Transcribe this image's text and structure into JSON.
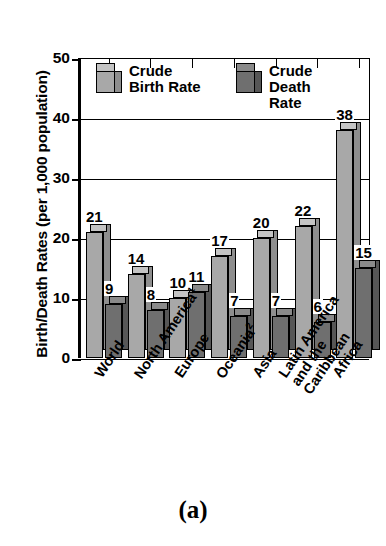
{
  "figure": {
    "caption": "(a)"
  },
  "chart_data": {
    "type": "bar",
    "title": "",
    "xlabel": "",
    "ylabel": "Birth/Death Rates (per 1,000 population)",
    "ylim": [
      0,
      50
    ],
    "yticks": [
      0,
      10,
      20,
      30,
      40,
      50
    ],
    "ytick_labels": [
      "0",
      "10",
      "20",
      "30",
      "40",
      "50"
    ],
    "grid": true,
    "legend_position": "inside-top",
    "categories": [
      "World",
      "North America¹",
      "Europe",
      "Oceania²",
      "Asia",
      "Latin America and the Caribbean",
      "Africa"
    ],
    "category_lines": [
      [
        "World"
      ],
      [
        "North America¹"
      ],
      [
        "Europe"
      ],
      [
        "Oceania²"
      ],
      [
        "Asia"
      ],
      [
        "Latin America",
        "and the",
        "Caribbean"
      ],
      [
        "Africa"
      ]
    ],
    "series": [
      {
        "name": "Crude Birth Rate",
        "legend_lines": [
          "Crude",
          "Birth Rate"
        ],
        "color": "#a8a8a8",
        "values": [
          21,
          14,
          10,
          17,
          20,
          22,
          38
        ]
      },
      {
        "name": "Crude Death Rate",
        "legend_lines": [
          "Crude",
          "Death Rate"
        ],
        "color": "#6f6f6f",
        "values": [
          9,
          8,
          11,
          7,
          7,
          6,
          15
        ]
      }
    ],
    "value_labels": [
      "21",
      "9",
      "14",
      "8",
      "10",
      "11",
      "17",
      "7",
      "20",
      "7",
      "22",
      "6",
      "38",
      "15"
    ]
  },
  "colors": {
    "birth_face": "#a8a8a8",
    "birth_side": "#8e8e8e",
    "birth_top": "#c4c4c4",
    "death_face": "#6f6f6f",
    "death_side": "#565656",
    "death_top": "#8a8a8a",
    "axis": "#000000",
    "background": "#ffffff"
  }
}
